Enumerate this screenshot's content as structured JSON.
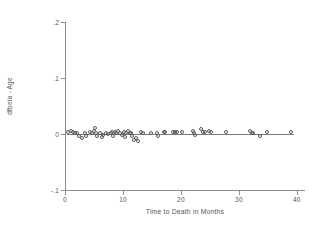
{
  "chart_data": {
    "type": "scatter",
    "title": "",
    "xlabel": "Time to Death in Months",
    "ylabel": "dfbeta - Age",
    "xlim": [
      0,
      41.4
    ],
    "ylim": [
      -0.1,
      0.2
    ],
    "xticks": [
      0,
      10,
      20,
      30,
      40
    ],
    "xticklabels": [
      "0",
      "10",
      "20",
      "30",
      "40"
    ],
    "yticks": [
      0.2,
      0.1,
      0,
      -0.1
    ],
    "yticklabels": [
      ".2",
      ".1",
      "0",
      "-.1"
    ],
    "grid": false,
    "legend": "none",
    "reference_line": {
      "orientation": "horizontal",
      "y": 0.0,
      "x_start": 0.3,
      "x_end": 39.5
    },
    "marker_style": "open-circle",
    "points": [
      {
        "x": 0.6,
        "y": 0.004
      },
      {
        "x": 1.0,
        "y": 0.006
      },
      {
        "x": 1.3,
        "y": 0.003
      },
      {
        "x": 1.8,
        "y": 0.001
      },
      {
        "x": 2.1,
        "y": 0.002
      },
      {
        "x": 2.4,
        "y": -0.004
      },
      {
        "x": 2.9,
        "y": -0.007
      },
      {
        "x": 3.4,
        "y": 0.002
      },
      {
        "x": 3.6,
        "y": -0.003
      },
      {
        "x": 4.3,
        "y": 0.003
      },
      {
        "x": 4.6,
        "y": 0.001
      },
      {
        "x": 5.0,
        "y": 0.006
      },
      {
        "x": 5.2,
        "y": 0.01
      },
      {
        "x": 5.4,
        "y": 0.002
      },
      {
        "x": 5.6,
        "y": -0.004
      },
      {
        "x": 6.0,
        "y": 0.001
      },
      {
        "x": 6.3,
        "y": -0.005
      },
      {
        "x": 6.6,
        "y": -0.002
      },
      {
        "x": 7.1,
        "y": 0.002
      },
      {
        "x": 7.5,
        "y": 0.0
      },
      {
        "x": 7.9,
        "y": 0.002
      },
      {
        "x": 8.1,
        "y": 0.004
      },
      {
        "x": 8.3,
        "y": -0.003
      },
      {
        "x": 8.6,
        "y": 0.003
      },
      {
        "x": 8.8,
        "y": 0.001
      },
      {
        "x": 9.2,
        "y": 0.005
      },
      {
        "x": 9.5,
        "y": 0.002
      },
      {
        "x": 9.8,
        "y": -0.001
      },
      {
        "x": 10.1,
        "y": 0.003
      },
      {
        "x": 10.3,
        "y": -0.006
      },
      {
        "x": 10.6,
        "y": 0.001
      },
      {
        "x": 10.9,
        "y": 0.005
      },
      {
        "x": 11.2,
        "y": 0.002
      },
      {
        "x": 11.4,
        "y": 0.001
      },
      {
        "x": 11.6,
        "y": -0.003
      },
      {
        "x": 11.9,
        "y": -0.011
      },
      {
        "x": 12.2,
        "y": -0.008
      },
      {
        "x": 12.6,
        "y": -0.012
      },
      {
        "x": 13.1,
        "y": 0.003
      },
      {
        "x": 13.4,
        "y": 0.001
      },
      {
        "x": 14.8,
        "y": 0.002
      },
      {
        "x": 15.8,
        "y": 0.002
      },
      {
        "x": 16.1,
        "y": -0.004
      },
      {
        "x": 17.0,
        "y": 0.004
      },
      {
        "x": 17.3,
        "y": 0.003
      },
      {
        "x": 18.6,
        "y": 0.004
      },
      {
        "x": 19.0,
        "y": 0.003
      },
      {
        "x": 19.4,
        "y": 0.004
      },
      {
        "x": 20.2,
        "y": 0.003
      },
      {
        "x": 22.1,
        "y": 0.005
      },
      {
        "x": 22.3,
        "y": 0.001
      },
      {
        "x": 22.5,
        "y": -0.002
      },
      {
        "x": 23.5,
        "y": 0.009
      },
      {
        "x": 23.8,
        "y": 0.004
      },
      {
        "x": 24.2,
        "y": 0.003
      },
      {
        "x": 24.8,
        "y": 0.006
      },
      {
        "x": 25.1,
        "y": 0.003
      },
      {
        "x": 27.7,
        "y": 0.003
      },
      {
        "x": 31.9,
        "y": 0.006
      },
      {
        "x": 32.2,
        "y": 0.002
      },
      {
        "x": 32.5,
        "y": 0.001
      },
      {
        "x": 33.6,
        "y": -0.003
      },
      {
        "x": 34.8,
        "y": 0.004
      },
      {
        "x": 38.9,
        "y": 0.004
      }
    ]
  }
}
